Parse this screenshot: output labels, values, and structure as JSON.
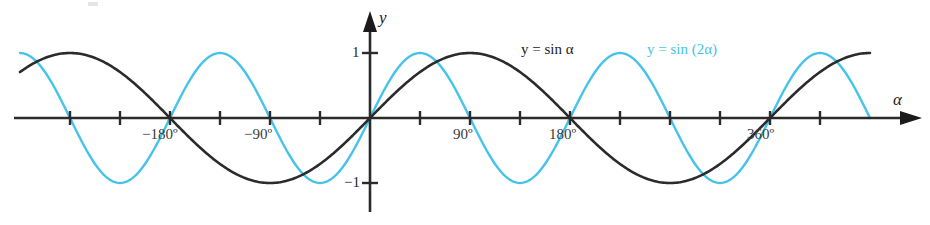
{
  "figure": {
    "name": "sine-comparison-plot",
    "background": "#ffffff"
  },
  "axes": {
    "x_axis_label": "α",
    "y_axis_label": "y",
    "origin_px": [
      370,
      118
    ],
    "px_per_45deg": 50,
    "amplitude_px": 65,
    "x_tick_labels": [
      {
        "text": "−180º",
        "value": -180,
        "x": 170
      },
      {
        "text": "−90º",
        "value": -90,
        "x": 270
      },
      {
        "text": "90º",
        "value": 90,
        "x": 470
      },
      {
        "text": "180º",
        "value": 180,
        "x": 570
      },
      {
        "text": "360º",
        "value": 360,
        "x": 770
      }
    ],
    "y_tick_labels": [
      {
        "text": "1",
        "value": 1
      },
      {
        "text": "−1",
        "value": -1
      }
    ]
  },
  "legend": [
    {
      "text": "y = sin α",
      "color": "#1b1b1b",
      "series": "sin-alpha"
    },
    {
      "text": "y = sin (2α)",
      "color": "#45c3ea",
      "series": "sin-2alpha"
    }
  ],
  "chart_data": {
    "type": "line",
    "title": "",
    "xlabel": "α",
    "ylabel": "y",
    "xlim": [
      -315,
      450
    ],
    "ylim": [
      -1,
      1
    ],
    "grid": false,
    "legend_position": "inside-top-center",
    "x_unit": "degrees",
    "x_tick_step": 45,
    "x_ticks": [
      -270,
      -225,
      -180,
      -135,
      -90,
      -45,
      0,
      45,
      90,
      135,
      180,
      225,
      270,
      315,
      360,
      405
    ],
    "x_tick_text": [
      "",
      "",
      "−180º",
      "",
      "−90º",
      "",
      "",
      "",
      "90º",
      "",
      "180º",
      "",
      "",
      "",
      "360º",
      ""
    ],
    "y_ticks": [
      -1,
      1
    ],
    "y_tick_text": [
      "−1",
      "1"
    ],
    "series": [
      {
        "name": "y = sin α",
        "color": "#1b1b1b",
        "formula": "sin(alpha)",
        "period_deg": 360,
        "amplitude": 1,
        "key_points": [
          {
            "x": -180,
            "y": 0
          },
          {
            "x": -90,
            "y": -1
          },
          {
            "x": 0,
            "y": 0
          },
          {
            "x": 90,
            "y": 1
          },
          {
            "x": 180,
            "y": 0
          },
          {
            "x": 270,
            "y": -1
          },
          {
            "x": 360,
            "y": 0
          },
          {
            "x": 450,
            "y": 1
          }
        ]
      },
      {
        "name": "y = sin (2α)",
        "color": "#45c3ea",
        "formula": "sin(2*alpha)",
        "period_deg": 180,
        "amplitude": 1,
        "key_points": [
          {
            "x": -180,
            "y": 0
          },
          {
            "x": -135,
            "y": -1
          },
          {
            "x": -90,
            "y": 0
          },
          {
            "x": -45,
            "y": 1
          },
          {
            "x": 0,
            "y": 0
          },
          {
            "x": 45,
            "y": -1
          },
          {
            "x": 90,
            "y": 0
          },
          {
            "x": 135,
            "y": 1
          },
          {
            "x": 180,
            "y": 0
          },
          {
            "x": 225,
            "y": -1
          },
          {
            "x": 270,
            "y": 0
          },
          {
            "x": 315,
            "y": 1
          },
          {
            "x": 360,
            "y": 0
          },
          {
            "x": 405,
            "y": -1
          }
        ]
      }
    ]
  }
}
